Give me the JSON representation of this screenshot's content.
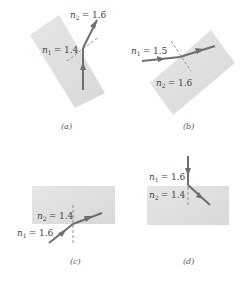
{
  "figure": {
    "colors": {
      "slab": "#e0e0e0",
      "ray": "#6e6e6e",
      "normal": "#7a7a7a",
      "text": "#444444"
    },
    "panels": [
      {
        "id": "a",
        "caption": "(a)",
        "n1": {
          "symbol": "n",
          "sub": "1",
          "value": "= 1.4"
        },
        "n2": {
          "symbol": "n",
          "sub": "2",
          "value": "= 1.6"
        }
      },
      {
        "id": "b",
        "caption": "(b)",
        "n1": {
          "symbol": "n",
          "sub": "1",
          "value": "= 1.5"
        },
        "n2": {
          "symbol": "n",
          "sub": "2",
          "value": "= 1.6"
        }
      },
      {
        "id": "c",
        "caption": "(c)",
        "n1": {
          "symbol": "n",
          "sub": "1",
          "value": "= 1.6"
        },
        "n2": {
          "symbol": "n",
          "sub": "2",
          "value": "= 1.4"
        }
      },
      {
        "id": "d",
        "caption": "(d)",
        "n1": {
          "symbol": "n",
          "sub": "1",
          "value": "= 1.6"
        },
        "n2": {
          "symbol": "n",
          "sub": "2",
          "value": "= 1.4"
        }
      }
    ]
  }
}
